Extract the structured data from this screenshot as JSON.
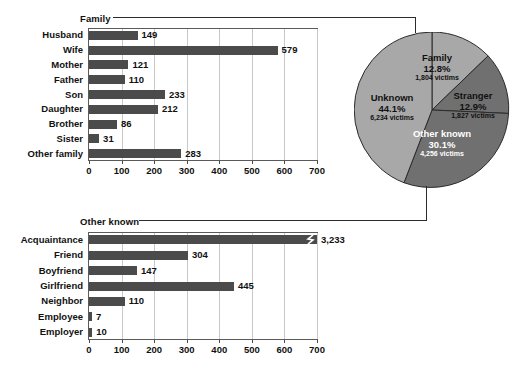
{
  "chart_data": [
    {
      "type": "bar",
      "orientation": "horizontal",
      "title": "Family",
      "xlabel": "",
      "ylabel": "",
      "xlim": [
        0,
        700
      ],
      "xticks": [
        0,
        100,
        200,
        300,
        400,
        500,
        600,
        700
      ],
      "grid": true,
      "categories": [
        "Husband",
        "Wife",
        "Mother",
        "Father",
        "Son",
        "Daughter",
        "Brother",
        "Sister",
        "Other family"
      ],
      "values": [
        149,
        579,
        121,
        110,
        233,
        212,
        86,
        31,
        283
      ],
      "value_labels": [
        "149",
        "579",
        "121",
        "110",
        "233",
        "212",
        "86",
        "31",
        "283"
      ],
      "bar_color": "#4b4b4b"
    },
    {
      "type": "pie",
      "title": "",
      "labels": [
        "Family",
        "Stranger",
        "Other known",
        "Unknown"
      ],
      "percents": [
        12.8,
        12.9,
        30.1,
        44.1
      ],
      "percent_labels": [
        "12.8%",
        "12.9%",
        "30.1%",
        "44.1%"
      ],
      "values": [
        1804,
        1827,
        4256,
        6234
      ],
      "value_labels": [
        "1,804 victims",
        "1,827 victims",
        "4,256 victims",
        "6,234 victims"
      ],
      "slice_colors": [
        "#a8a8a8",
        "#707070",
        "#707070",
        "#a8a8a8"
      ],
      "label_colors": [
        "#111111",
        "#111111",
        "#ffffff",
        "#111111"
      ],
      "legend": "none"
    },
    {
      "type": "bar",
      "orientation": "horizontal",
      "title": "Other known",
      "xlabel": "",
      "ylabel": "",
      "xlim": [
        0,
        700
      ],
      "xticks": [
        0,
        100,
        200,
        300,
        400,
        500,
        600,
        700
      ],
      "grid": true,
      "categories": [
        "Acquaintance",
        "Friend",
        "Boyfriend",
        "Girlfriend",
        "Neighbor",
        "Employee",
        "Employer"
      ],
      "values": [
        3233,
        304,
        147,
        445,
        110,
        7,
        10
      ],
      "value_labels": [
        "3,233",
        "304",
        "147",
        "445",
        "110",
        "7",
        "10"
      ],
      "axis_break": {
        "category": "Acquaintance",
        "marker": "zigzag-break-icon"
      },
      "bar_color": "#4b4b4b"
    }
  ],
  "family_panel": {
    "title": "Family",
    "categories": [
      "Husband",
      "Wife",
      "Mother",
      "Father",
      "Son",
      "Daughter",
      "Brother",
      "Sister",
      "Other family"
    ],
    "value_labels": [
      "149",
      "579",
      "121",
      "110",
      "233",
      "212",
      "86",
      "31",
      "283"
    ],
    "ticks": [
      "0",
      "100",
      "200",
      "300",
      "400",
      "500",
      "600",
      "700"
    ]
  },
  "other_known_panel": {
    "title": "Other known",
    "categories": [
      "Acquaintance",
      "Friend",
      "Boyfriend",
      "Girlfriend",
      "Neighbor",
      "Employee",
      "Employer"
    ],
    "value_labels": [
      "3,233",
      "304",
      "147",
      "445",
      "110",
      "7",
      "10"
    ],
    "ticks": [
      "0",
      "100",
      "200",
      "300",
      "400",
      "500",
      "600",
      "700"
    ]
  },
  "pie_panel": {
    "slices": [
      {
        "name": "Family",
        "pct": "12.8%",
        "victims": "1,804 victims"
      },
      {
        "name": "Stranger",
        "pct": "12.9%",
        "victims": "1,827 victims"
      },
      {
        "name": "Other known",
        "pct": "30.1%",
        "victims": "4,256 victims"
      },
      {
        "name": "Unknown",
        "pct": "44.1%",
        "victims": "6,234 victims"
      }
    ]
  }
}
